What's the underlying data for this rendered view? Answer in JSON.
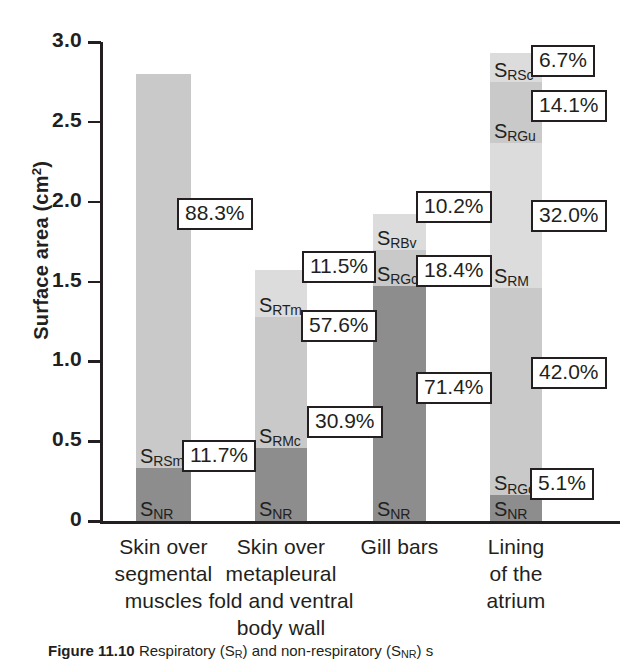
{
  "chart_data": {
    "type": "bar",
    "subtype": "stacked-bar",
    "title": "",
    "xlabel": "",
    "ylabel": "Surface area (cm²)",
    "ylim": [
      0,
      3.0
    ],
    "ytick_labels": [
      "3.0",
      "2.5",
      "2.0",
      "1.5",
      "1.0",
      "0.5",
      "0"
    ],
    "ytick_values": [
      3.0,
      2.5,
      2.0,
      1.5,
      1.0,
      0.5,
      0
    ],
    "grid": false,
    "legend": "none",
    "categories": [
      "Skin over segmental muscles",
      "Skin over metapleural fold and ventral body wall",
      "Gill bars",
      "Lining of the atrium"
    ],
    "bars": [
      {
        "category_lines": [
          "Skin over",
          "segmental",
          "muscles"
        ],
        "total": 2.8,
        "segments": [
          {
            "name": "S_NR",
            "label_main": "S",
            "label_sub": "NR",
            "value": 0.33,
            "percent": "11.7%",
            "shade": "dark"
          },
          {
            "name": "S_RSm",
            "label_main": "S",
            "label_sub": "RSm",
            "value": 2.47,
            "percent": "88.3%",
            "shade": "light"
          }
        ]
      },
      {
        "category_lines": [
          "Skin over",
          "metapleural",
          "fold and ventral",
          "body wall"
        ],
        "total": 1.56,
        "segments": [
          {
            "name": "S_NR",
            "label_main": "S",
            "label_sub": "NR",
            "value": 0.46,
            "percent": "30.9%",
            "shade": "dark"
          },
          {
            "name": "S_RMc",
            "label_main": "S",
            "label_sub": "RMc",
            "value": 0.82,
            "percent": "57.6%",
            "shade": "light"
          },
          {
            "name": "S_RTm",
            "label_main": "S",
            "label_sub": "RTm",
            "value": 0.29,
            "percent": "11.5%",
            "shade": "lighter"
          }
        ]
      },
      {
        "category_lines": [
          "Gill bars"
        ],
        "total": 1.92,
        "segments": [
          {
            "name": "S_NR",
            "label_main": "S",
            "label_sub": "NR",
            "value": 1.47,
            "percent": "71.4%",
            "shade": "dark"
          },
          {
            "name": "S_RGc",
            "label_main": "S",
            "label_sub": "RGc",
            "value": 0.23,
            "percent": "18.4%",
            "shade": "light"
          },
          {
            "name": "S_RBv",
            "label_main": "S",
            "label_sub": "RBv",
            "value": 0.22,
            "percent": "10.2%",
            "shade": "lighter"
          }
        ]
      },
      {
        "category_lines": [
          "Lining",
          "of the",
          "atrium"
        ],
        "total": 2.77,
        "segments": [
          {
            "name": "S_NR",
            "label_main": "S",
            "label_sub": "NR",
            "value": 0.16,
            "percent": "5.1%",
            "shade": "dark"
          },
          {
            "name": "S_RGo",
            "label_main": "S",
            "label_sub": "RGo",
            "value": 1.3,
            "percent": "42.0%",
            "shade": "light"
          },
          {
            "name": "S_RM",
            "label_main": "S",
            "label_sub": "RM",
            "value": 0.91,
            "percent": "32.0%",
            "shade": "lighter"
          },
          {
            "name": "S_RGu",
            "label_main": "S",
            "label_sub": "RGu",
            "value": 0.38,
            "percent": "14.1%",
            "shade": "light"
          },
          {
            "name": "S_RSc",
            "label_main": "S",
            "label_sub": "RSc",
            "value": 0.18,
            "percent": "6.7%",
            "shade": "lighter"
          }
        ]
      }
    ],
    "colors": {
      "dark": "#8d8d8d",
      "light": "#c9c9c9",
      "lighter": "#dcdcdc",
      "axis": "#231f20",
      "text": "#231f20",
      "background": "#ffffff"
    }
  },
  "caption": {
    "figure_number": "Figure 11.10",
    "text": "Respiratory (S",
    "text_sub1": "R",
    "text_mid": ") and non-respiratory (S",
    "text_sub2": "NR",
    "text_end": ") s"
  }
}
